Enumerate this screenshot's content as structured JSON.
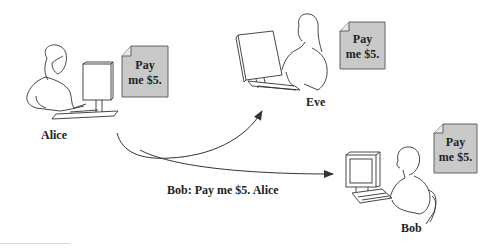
{
  "diagram": {
    "type": "message-forgery-scenario",
    "colors": {
      "note_fill": "#c9c9c9",
      "stroke": "#333333",
      "background": "#ffffff"
    },
    "actors": [
      {
        "id": "alice",
        "name": "Alice",
        "note": {
          "line1": "Pay",
          "line2": "me $5."
        }
      },
      {
        "id": "eve",
        "name": "Eve",
        "note": {
          "line1": "Pay",
          "line2": "me $5."
        }
      },
      {
        "id": "bob",
        "name": "Bob",
        "note": {
          "line1": "Pay",
          "line2": "me $5."
        }
      }
    ],
    "edges": [
      {
        "from": "alice",
        "to": "eve",
        "label": ""
      },
      {
        "from": "alice",
        "to": "bob",
        "label": "Bob: Pay me $5. Alice"
      }
    ],
    "message_label": "Bob: Pay me $5. Alice"
  }
}
